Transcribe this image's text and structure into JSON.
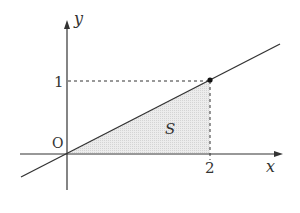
{
  "diagram": {
    "type": "coordinate-plot",
    "labels": {
      "y_axis": "y",
      "x_axis": "x",
      "origin": "O",
      "y_tick": "1",
      "x_tick": "2",
      "region": "S"
    },
    "line": {
      "equation": "y = x/2",
      "through": [
        [
          0,
          0
        ],
        [
          2,
          1
        ]
      ]
    },
    "point": [
      2,
      1
    ],
    "shaded_region": "triangle between line, x-axis, and x = 2",
    "colors": {
      "axis": "#333333",
      "line": "#333333",
      "shade": "#e6e6e6",
      "dash": "#333333"
    }
  }
}
